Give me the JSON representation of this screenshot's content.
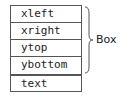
{
  "diagram": {
    "group_fields": [
      "xleft",
      "xright",
      "ytop",
      "ybottom"
    ],
    "separate_field": "text",
    "brace_label": "Box",
    "stroke_color": "#555555"
  }
}
